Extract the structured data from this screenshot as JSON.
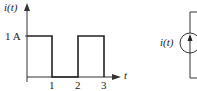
{
  "waveform": {
    "y_label": "i(t)",
    "x_label": "t",
    "level_label": "1 A",
    "ticks": [
      "1",
      "2",
      "3"
    ]
  },
  "source": {
    "label": "i(t)",
    "type": "current-source",
    "arrow_direction": "up"
  },
  "colors": {
    "line": "#222222",
    "axis": "#333333",
    "background": "#ffffff"
  }
}
